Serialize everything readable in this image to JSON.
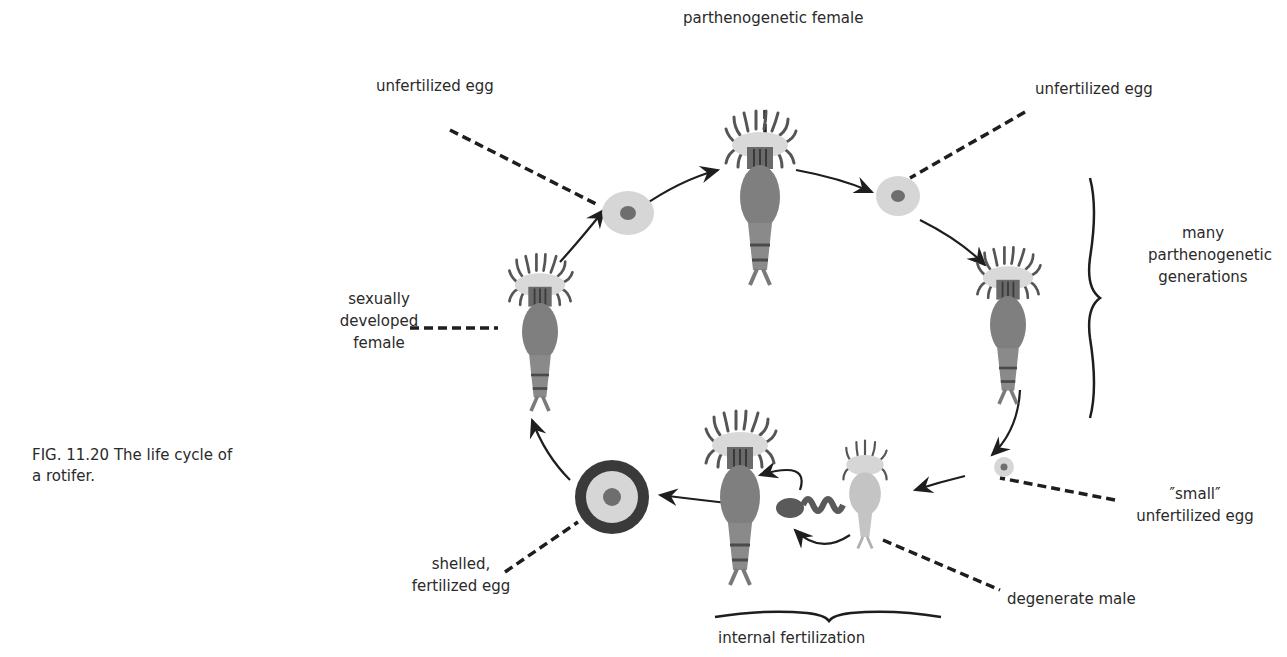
{
  "figure": {
    "caption_line1": "FIG. 11.20  The life cycle of",
    "caption_line2": "a rotifer."
  },
  "labels": {
    "parthenogenetic_female": "parthenogenetic female",
    "unfertilized_egg_left": "unfertilized egg",
    "unfertilized_egg_right": "unfertilized egg",
    "many_generations_line1": "many",
    "many_generations_line2": "parthenogenetic",
    "many_generations_line3": "generations",
    "sexually_developed_line1": "sexually",
    "sexually_developed_line2": "developed",
    "sexually_developed_line3": "female",
    "small_egg_line1": "″small″",
    "small_egg_line2": "unfertilized egg",
    "degenerate_male": "degenerate male",
    "shelled_line1": "shelled,",
    "shelled_line2": "fertilized egg",
    "internal_fertilization": "internal fertilization"
  },
  "colors": {
    "ink": "#1e1e1e",
    "body": "#7f7f7f",
    "corona": "#d9d9d9",
    "egg": "#d6d6d6",
    "nucleus": "#6e6e6e",
    "shell": "#3a3a3a",
    "male_body": "#c4c4c4"
  }
}
